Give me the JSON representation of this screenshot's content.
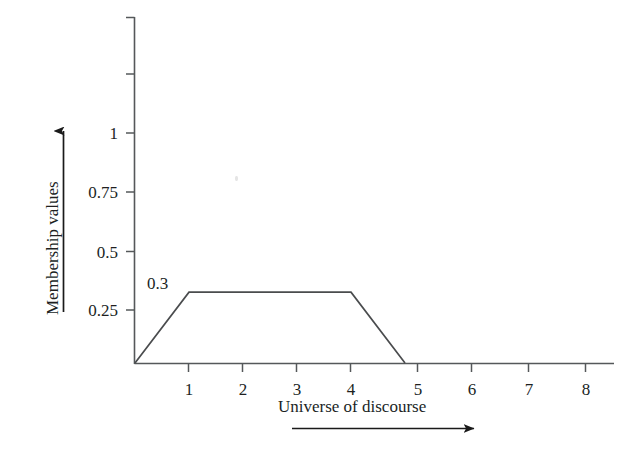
{
  "chart_data": {
    "type": "line",
    "title": "",
    "subtitle": "",
    "xlabel": "Universe of discourse",
    "ylabel": "Membership values",
    "xlim": [
      0,
      8.8
    ],
    "ylim": [
      0,
      1.5
    ],
    "grid": false,
    "legend": null,
    "xticks": [
      1,
      2,
      3,
      4,
      5,
      6,
      7,
      8
    ],
    "xtick_labels": [
      "1",
      "2",
      "3",
      "4",
      "5",
      "6",
      "7",
      "8"
    ],
    "yticks": [
      0.25,
      0.5,
      0.75,
      1,
      1.25,
      1.5
    ],
    "ytick_labels": [
      "0.25",
      "0.5",
      "0.75",
      "1",
      "",
      ""
    ],
    "annotations": [
      {
        "text": "0.3",
        "x": 0.72,
        "y": 0.36
      }
    ],
    "series": [
      {
        "name": "trapezoidal membership function",
        "x": [
          0,
          1,
          4,
          5
        ],
        "values": [
          0,
          0.3,
          0.3,
          0
        ]
      }
    ]
  },
  "axes": {
    "y_label": "Membership values",
    "x_label": "Universe of discourse",
    "y_tick_labels": [
      "1",
      "0.75",
      "0.5",
      "0.25"
    ],
    "x_tick_labels": [
      "1",
      "2",
      "3",
      "4",
      "5",
      "6",
      "7",
      "8"
    ]
  },
  "annotation": {
    "plateau_value": "0.3"
  },
  "icons": {
    "y_direction_arrow": "arrow-up-icon",
    "x_direction_arrow": "arrow-right-icon"
  }
}
